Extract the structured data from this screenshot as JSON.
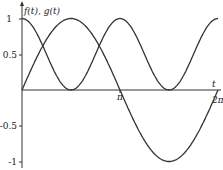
{
  "chart_data": {
    "type": "line",
    "title": "",
    "xlabel": "t",
    "ylabel": "f(t), g(t)",
    "xlim": [
      0,
      6.2832
    ],
    "ylim": [
      -1,
      1
    ],
    "x_ticks": [
      {
        "value": 3.1416,
        "label": "π"
      },
      {
        "value": 6.2832,
        "label": "2π"
      }
    ],
    "y_ticks": [
      {
        "value": 1,
        "label": "1"
      },
      {
        "value": 0.5,
        "label": "0.5"
      },
      {
        "value": -0.5,
        "label": "-0.5"
      },
      {
        "value": -1,
        "label": "-1"
      }
    ],
    "grid": false,
    "legend": null,
    "series": [
      {
        "name": "f(t) = sin(t)",
        "x": [
          0,
          0.785,
          1.571,
          2.356,
          3.142,
          3.927,
          4.712,
          5.498,
          6.283
        ],
        "values": [
          0,
          0.707,
          1,
          0.707,
          0,
          -0.707,
          -1,
          -0.707,
          0
        ],
        "color": "#333333"
      },
      {
        "name": "g(t) = cos²(t)",
        "x": [
          0,
          0.785,
          1.571,
          2.356,
          3.142,
          3.927,
          4.712,
          5.498,
          6.283
        ],
        "values": [
          1,
          0.5,
          0,
          0.5,
          1,
          0.5,
          0,
          0.5,
          1
        ],
        "color": "#333333"
      }
    ]
  },
  "labels": {
    "y_axis": "f(t), g(t)",
    "x_axis": "t",
    "tick_1": "1",
    "tick_05": "0.5",
    "tick_m05": "-0.5",
    "tick_m1": "-1",
    "tick_pi": "π",
    "tick_2pi": "2π"
  }
}
